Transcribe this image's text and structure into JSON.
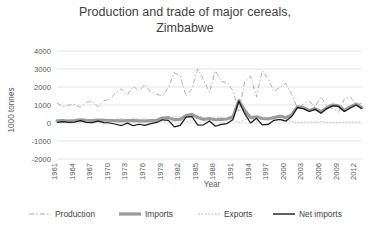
{
  "chart_data": {
    "type": "line",
    "title": "Production and trade of major cereals, Zimbabwe",
    "title_line1": "Production and trade of major cereals,",
    "title_line2": "Zimbabwe",
    "xlabel": "Year",
    "ylabel": "1000 tonnes",
    "ylim": [
      -2000,
      4000
    ],
    "ytick_values": [
      4000,
      3000,
      2000,
      1000,
      0,
      -1000,
      -2000
    ],
    "ytick_labels": [
      "4000",
      "3000",
      "2000",
      "1000",
      "0",
      "-1000",
      "-2000"
    ],
    "xlim": [
      1961,
      2013
    ],
    "xtick_values": [
      1961,
      1964,
      1967,
      1970,
      1973,
      1976,
      1979,
      1982,
      1985,
      1988,
      1991,
      1994,
      1997,
      2000,
      2003,
      2006,
      2009,
      2012
    ],
    "xtick_labels": [
      "1961",
      "1964",
      "1967",
      "1970",
      "1973",
      "1976",
      "1979",
      "1982",
      "1985",
      "1988",
      "1991",
      "1994",
      "1997",
      "2000",
      "2003",
      "2006",
      "2009",
      "2012"
    ],
    "grid": "horizontal",
    "legend_position": "bottom",
    "x": [
      1961,
      1962,
      1963,
      1964,
      1965,
      1966,
      1967,
      1968,
      1969,
      1970,
      1971,
      1972,
      1973,
      1974,
      1975,
      1976,
      1977,
      1978,
      1979,
      1980,
      1981,
      1982,
      1983,
      1984,
      1985,
      1986,
      1987,
      1988,
      1989,
      1990,
      1991,
      1992,
      1993,
      1994,
      1995,
      1996,
      1997,
      1998,
      1999,
      2000,
      2001,
      2002,
      2003,
      2004,
      2005,
      2006,
      2007,
      2008,
      2009,
      2010,
      2011,
      2012,
      2013
    ],
    "series": [
      {
        "name": "Production",
        "color": "#a6a6a6",
        "style": "dash-dot",
        "values": [
          1100,
          900,
          1000,
          1020,
          880,
          1150,
          1200,
          900,
          1250,
          1300,
          1700,
          1900,
          1550,
          2050,
          1750,
          2150,
          1700,
          1600,
          1500,
          2000,
          2800,
          2600,
          1500,
          1900,
          3000,
          2400,
          1700,
          2900,
          2300,
          2250,
          1800,
          600,
          2300,
          2600,
          1450,
          2900,
          2450,
          1750,
          2000,
          2200,
          1600,
          800,
          1050,
          1200,
          900,
          1450,
          950,
          800,
          600,
          1350,
          1450,
          1000,
          1100
        ]
      },
      {
        "name": "Imports",
        "color": "#9a9a9a",
        "style": "thick-solid",
        "values": [
          120,
          130,
          110,
          140,
          180,
          150,
          130,
          160,
          150,
          140,
          130,
          120,
          140,
          130,
          120,
          110,
          130,
          150,
          280,
          300,
          180,
          200,
          420,
          480,
          300,
          200,
          250,
          180,
          200,
          220,
          350,
          1250,
          700,
          300,
          350,
          250,
          220,
          300,
          380,
          300,
          450,
          900,
          850,
          700,
          800,
          620,
          850,
          1000,
          950,
          700,
          900,
          1050,
          850
        ]
      },
      {
        "name": "Exports",
        "color": "#b0b0b0",
        "style": "dotted",
        "values": [
          80,
          60,
          70,
          90,
          50,
          120,
          110,
          60,
          130,
          140,
          200,
          260,
          150,
          280,
          190,
          240,
          160,
          120,
          100,
          150,
          400,
          330,
          90,
          120,
          420,
          300,
          140,
          360,
          280,
          250,
          160,
          30,
          180,
          300,
          90,
          350,
          300,
          150,
          180,
          200,
          90,
          40,
          50,
          60,
          40,
          80,
          50,
          40,
          30,
          60,
          70,
          50,
          60
        ]
      },
      {
        "name": "Net imports",
        "color": "#1a1a1a",
        "style": "solid",
        "values": [
          40,
          70,
          40,
          50,
          130,
          30,
          20,
          100,
          20,
          0,
          -70,
          -140,
          -10,
          -150,
          -70,
          -130,
          -30,
          30,
          180,
          150,
          -220,
          -130,
          330,
          360,
          -120,
          -100,
          110,
          -180,
          -80,
          -30,
          190,
          1220,
          520,
          0,
          260,
          -100,
          -80,
          150,
          200,
          100,
          360,
          860,
          800,
          640,
          760,
          540,
          800,
          960,
          920,
          640,
          830,
          1000,
          790
        ]
      }
    ]
  },
  "legend": {
    "items": [
      {
        "label": "Production"
      },
      {
        "label": "Imports"
      },
      {
        "label": "Exports"
      },
      {
        "label": "Net imports"
      }
    ]
  }
}
